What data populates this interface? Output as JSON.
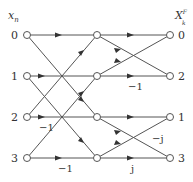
{
  "diagram": {
    "input_header": "x",
    "input_header_sub": "n",
    "output_header": "X",
    "output_header_sup": "F",
    "output_header_sub": "k",
    "input_labels": [
      "0",
      "1",
      "2",
      "3"
    ],
    "output_labels": [
      "0",
      "2",
      "1",
      "3"
    ],
    "stage1_weights": {
      "row2_straight": "−1",
      "row3_straight": "−1"
    },
    "stage2_weights": {
      "row1_straight": "−1",
      "row3_straight": "j",
      "row3_to_row2": "−j"
    },
    "colors": {
      "line": "#555555",
      "text": "#333333",
      "background": "#ffffff"
    }
  }
}
